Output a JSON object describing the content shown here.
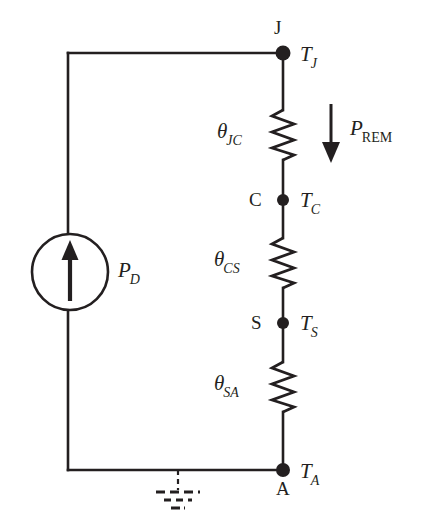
{
  "figure": {
    "type": "thermal-resistance-circuit-diagram",
    "background_color": "#ffffff",
    "line_color": "#231f20",
    "text_color": "#231f20"
  },
  "source": {
    "symbol": "current-source-circle-with-up-arrow",
    "label_base": "P",
    "label_sub": "D",
    "arrow_direction": "up",
    "center_x": 70,
    "center_y": 272,
    "radius": 38
  },
  "nodes": [
    {
      "id": "J",
      "letter": "J",
      "letter_position": "above",
      "temperature_base": "T",
      "temperature_sub": "J",
      "x": 283,
      "y": 53
    },
    {
      "id": "C",
      "letter": "C",
      "letter_position": "left",
      "temperature_base": "T",
      "temperature_sub": "C",
      "x": 283,
      "y": 200
    },
    {
      "id": "S",
      "letter": "S",
      "letter_position": "left",
      "temperature_base": "T",
      "temperature_sub": "S",
      "x": 283,
      "y": 323
    },
    {
      "id": "A",
      "letter": "A",
      "letter_position": "below",
      "temperature_base": "T",
      "temperature_sub": "A",
      "x": 283,
      "y": 470
    }
  ],
  "resistors": [
    {
      "id": "theta-jc",
      "label_base": "θ",
      "label_sub": "JC",
      "from_node": "J",
      "to_node": "C",
      "x": 283,
      "y_top": 110,
      "y_bottom": 160
    },
    {
      "id": "theta-cs",
      "label_base": "θ",
      "label_sub": "CS",
      "from_node": "C",
      "to_node": "S",
      "x": 283,
      "y_top": 238,
      "y_bottom": 288
    },
    {
      "id": "theta-sa",
      "label_base": "θ",
      "label_sub": "SA",
      "from_node": "S",
      "to_node": "A",
      "x": 283,
      "y_top": 362,
      "y_bottom": 412
    }
  ],
  "power_flow_arrow": {
    "id": "p-rem",
    "label_base": "P",
    "label_sub": "REM",
    "direction": "down",
    "x": 331,
    "y_start": 104,
    "y_end": 162
  },
  "ground": {
    "symbol": "dashed-ground",
    "style": "dashed",
    "x": 178,
    "y_top": 470,
    "bars": [
      {
        "half_width": 22,
        "y": 492
      },
      {
        "half_width": 14,
        "y": 500
      },
      {
        "half_width": 7,
        "y": 508
      }
    ]
  },
  "wires": {
    "top_left_corner_x": 68,
    "top_left_corner_y": 53,
    "bottom_left_corner_x": 68,
    "bottom_left_corner_y": 470,
    "right_rail_x": 283
  }
}
